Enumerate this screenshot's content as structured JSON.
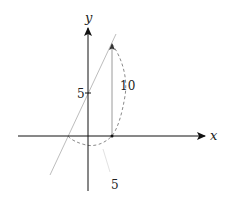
{
  "diagram": {
    "axes": {
      "x_label": "x",
      "y_label": "y"
    },
    "ticks": {
      "y_tick_label": "5"
    },
    "annotations": {
      "vertical_segment_label": "10",
      "bottom_label": "5"
    },
    "colors": {
      "axis": "#111111",
      "line": "#bdbdbd",
      "dashed_curve": "#8a8a8a",
      "segment": "#9a9a9a"
    }
  }
}
